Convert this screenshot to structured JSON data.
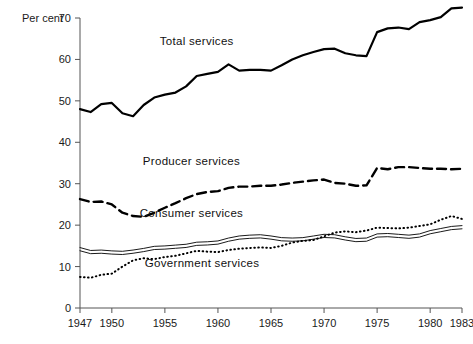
{
  "chart_data": {
    "type": "line",
    "title": "",
    "ylabel": "Per cent",
    "xlabel": "",
    "ylim": [
      0,
      70
    ],
    "yticks": [
      0,
      10,
      20,
      30,
      40,
      50,
      60,
      70
    ],
    "xlim": [
      1947,
      1983
    ],
    "xticks": [
      1947,
      1950,
      1955,
      1960,
      1965,
      1970,
      1975,
      1980,
      1983
    ],
    "grid": false,
    "legend": "inline-annotations",
    "x": [
      1947,
      1948,
      1949,
      1950,
      1951,
      1952,
      1953,
      1954,
      1955,
      1956,
      1957,
      1958,
      1959,
      1960,
      1961,
      1962,
      1963,
      1964,
      1965,
      1966,
      1967,
      1968,
      1969,
      1970,
      1971,
      1972,
      1973,
      1974,
      1975,
      1976,
      1977,
      1978,
      1979,
      1980,
      1981,
      1982,
      1983
    ],
    "series": [
      {
        "name": "Total services",
        "style": "solid-thick",
        "label_x": 1958,
        "label_y": 63.5,
        "values": [
          48.0,
          47.3,
          49.2,
          49.5,
          47.0,
          46.3,
          49.0,
          50.8,
          51.5,
          52.0,
          53.5,
          56.0,
          56.5,
          57.0,
          58.8,
          57.3,
          57.5,
          57.5,
          57.3,
          58.6,
          60.0,
          61.0,
          61.8,
          62.5,
          62.6,
          61.5,
          61.0,
          60.8,
          66.6,
          67.5,
          67.7,
          67.3,
          69.0,
          69.5,
          70.2,
          72.3,
          72.5
        ]
      },
      {
        "name": "Producer services",
        "style": "dashed",
        "label_x": 1957.5,
        "label_y": 34.5,
        "values": [
          26.3,
          25.6,
          25.7,
          25.0,
          23.0,
          22.2,
          22.0,
          23.0,
          24.2,
          25.3,
          26.5,
          27.5,
          28.0,
          28.2,
          29.0,
          29.3,
          29.3,
          29.5,
          29.5,
          29.8,
          30.2,
          30.5,
          30.8,
          31.0,
          30.2,
          30.0,
          29.5,
          29.6,
          33.8,
          33.5,
          34.0,
          34.0,
          33.8,
          33.6,
          33.6,
          33.5,
          33.6
        ]
      },
      {
        "name": "Consumer services",
        "style": "solid-double-thin",
        "label_x": 1957.5,
        "label_y": 22.0,
        "values": [
          14.2,
          13.5,
          13.6,
          13.4,
          13.3,
          13.6,
          14.0,
          14.5,
          14.6,
          14.8,
          15.0,
          15.5,
          15.6,
          15.8,
          16.5,
          17.0,
          17.2,
          17.3,
          17.0,
          16.6,
          16.5,
          16.6,
          17.0,
          17.4,
          17.3,
          16.8,
          16.4,
          16.5,
          17.5,
          17.6,
          17.4,
          17.2,
          17.5,
          18.3,
          18.8,
          19.3,
          19.5
        ]
      },
      {
        "name": "Government services",
        "style": "dotted",
        "label_x": 1958.5,
        "label_y": 10.0,
        "values": [
          7.5,
          7.3,
          8.0,
          8.3,
          10.0,
          11.5,
          12.0,
          11.8,
          12.3,
          12.6,
          13.2,
          13.8,
          13.6,
          13.5,
          14.0,
          14.3,
          14.5,
          14.6,
          14.5,
          15.0,
          15.8,
          16.2,
          16.4,
          17.3,
          18.2,
          18.5,
          18.3,
          18.7,
          19.4,
          19.3,
          19.2,
          19.4,
          19.8,
          20.2,
          21.3,
          22.2,
          21.5
        ]
      }
    ]
  }
}
